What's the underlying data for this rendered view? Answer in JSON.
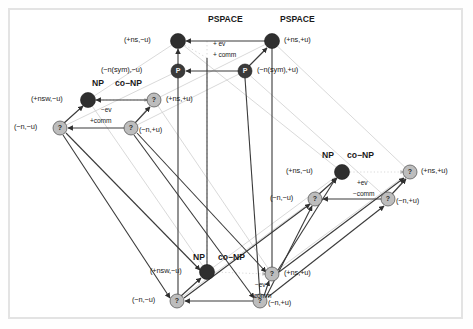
{
  "figure": {
    "background": "#ffffff",
    "frame_color": "#e3e3e3",
    "node_dark": "#2f2f2f",
    "node_light": "#bdbdbd",
    "edge_solid": "#3a3a3a",
    "edge_faint": "#cfcfcf",
    "text_color": "#1a1a1a"
  },
  "cubes": [
    {
      "id": "top",
      "class_label_left": "PSPACE",
      "class_label_right": "PSPACE",
      "op_line_1": "+ ev",
      "op_line_2": "+ comm",
      "nodes": [
        {
          "id": "t-back-left",
          "glyph": "",
          "fill": "dark",
          "label": "(+ns,−u)",
          "label_side": "left",
          "x": 178,
          "y": 41
        },
        {
          "id": "t-back-right",
          "glyph": "",
          "fill": "dark",
          "label": "(+ns,+u)",
          "label_side": "right",
          "x": 272,
          "y": 41
        },
        {
          "id": "t-front-left",
          "glyph": "P",
          "fill": "dark",
          "label": "(−n(sym),−u)",
          "label_side": "left",
          "x": 178,
          "y": 71
        },
        {
          "id": "t-front-right",
          "glyph": "P",
          "fill": "dark",
          "label": "(−n(sym),+u)",
          "label_side": "right",
          "x": 245,
          "y": 71
        }
      ]
    },
    {
      "id": "left",
      "class_label_left": "NP",
      "class_label_right": "co−NP",
      "op_line_1": "−ev",
      "op_line_2": "+comm",
      "nodes": [
        {
          "id": "l-back-left",
          "glyph": "",
          "fill": "dark",
          "label": "(+nsw,−u)",
          "label_side": "left",
          "x": 88,
          "y": 100
        },
        {
          "id": "l-back-right",
          "glyph": "?",
          "fill": "light",
          "label": "(+ns,+u)",
          "label_side": "right",
          "x": 154,
          "y": 100
        },
        {
          "id": "l-front-left",
          "glyph": "?",
          "fill": "light",
          "label": "(−n,−u)",
          "label_side": "left",
          "x": 60,
          "y": 128
        },
        {
          "id": "l-front-right",
          "glyph": "?",
          "fill": "light",
          "label": "(−n,+u)",
          "label_side": "right",
          "x": 131,
          "y": 128
        }
      ]
    },
    {
      "id": "right",
      "class_label_left": "NP",
      "class_label_right": "co−NP",
      "op_line_1": "+ev",
      "op_line_2": "−comm",
      "nodes": [
        {
          "id": "r-back-left",
          "glyph": "",
          "fill": "dark",
          "label": "(+ns,−u)",
          "label_side": "left",
          "x": 342,
          "y": 172
        },
        {
          "id": "r-back-right",
          "glyph": "?",
          "fill": "light",
          "label": "(+ns,+u)",
          "label_side": "right",
          "x": 410,
          "y": 172
        },
        {
          "id": "r-front-left",
          "glyph": "?",
          "fill": "light",
          "label": "(−n,−u)",
          "label_side": "left",
          "x": 315,
          "y": 199
        },
        {
          "id": "r-front-right",
          "glyph": "?",
          "fill": "light",
          "label": "(−n,+u)",
          "label_side": "right",
          "x": 388,
          "y": 199
        }
      ]
    },
    {
      "id": "bottom",
      "class_label_left": "NP",
      "class_label_right": "co−NP",
      "op_line_1": "−ev",
      "op_line_2": "−comm",
      "nodes": [
        {
          "id": "b-back-left",
          "glyph": "",
          "fill": "dark",
          "label": "(+nsw,−u)",
          "label_side": "left",
          "x": 207,
          "y": 272
        },
        {
          "id": "b-back-right",
          "glyph": "?",
          "fill": "light",
          "label": "(+ns,+u)",
          "label_side": "right",
          "x": 272,
          "y": 274
        },
        {
          "id": "b-front-left",
          "glyph": "?",
          "fill": "light",
          "label": "(−n,−u)",
          "label_side": "left",
          "x": 177,
          "y": 301
        },
        {
          "id": "b-front-right",
          "glyph": "?",
          "fill": "light",
          "label": "(−n,+u)",
          "label_side": "right",
          "x": 260,
          "y": 301
        }
      ]
    }
  ],
  "class_labels": [
    {
      "id": "top-left-class",
      "text": "PSPACE",
      "x": 208,
      "y": 22
    },
    {
      "id": "top-right-class",
      "text": "PSPACE",
      "x": 280,
      "y": 22
    },
    {
      "id": "left-np",
      "text": "NP",
      "x": 95,
      "y": 85
    },
    {
      "id": "left-conp",
      "text": "co−NP",
      "x": 118,
      "y": 85
    },
    {
      "id": "right-np",
      "text": "NP",
      "x": 325,
      "y": 158
    },
    {
      "id": "right-conp",
      "text": "co−NP",
      "x": 350,
      "y": 158
    },
    {
      "id": "bottom-np",
      "text": "NP",
      "x": 196,
      "y": 259
    },
    {
      "id": "bottom-conp",
      "text": "co−NP",
      "x": 221,
      "y": 259
    }
  ],
  "op_labels": [
    {
      "id": "top-op1",
      "text": "+ ev",
      "x": 214,
      "y": 44
    },
    {
      "id": "top-op2",
      "text": "+ comm",
      "x": 214,
      "y": 55
    },
    {
      "id": "left-op1",
      "text": "−ev",
      "x": 102,
      "y": 110
    },
    {
      "id": "left-op2",
      "text": "+comm",
      "x": 91,
      "y": 121
    },
    {
      "id": "right-op1",
      "text": "+ev",
      "x": 358,
      "y": 183
    },
    {
      "id": "right-op2",
      "text": "−comm",
      "x": 354,
      "y": 194
    },
    {
      "id": "bottom-op1",
      "text": "−ev",
      "x": 256,
      "y": 285
    },
    {
      "id": "bottom-op2",
      "text": "−comm",
      "x": 251,
      "y": 296
    }
  ],
  "node_labels": [
    {
      "id": "t-bl-label",
      "text": "(+ns,−u)",
      "x": 125,
      "y": 38,
      "align": "left"
    },
    {
      "id": "t-br-label",
      "text": "(+ns,+u)",
      "x": 286,
      "y": 38,
      "align": "left"
    },
    {
      "id": "t-fl-label",
      "text": "(−n(sym),−u)",
      "x": 103,
      "y": 68,
      "align": "left"
    },
    {
      "id": "t-fr-label",
      "text": "(−n(sym),+u)",
      "x": 259,
      "y": 68,
      "align": "left"
    },
    {
      "id": "l-bl-label",
      "text": "(+nsw,−u)",
      "x": 33,
      "y": 97,
      "align": "left"
    },
    {
      "id": "l-br-label",
      "text": "(+ns,+u)",
      "x": 168,
      "y": 97,
      "align": "left"
    },
    {
      "id": "l-fl-label",
      "text": "(−n,−u)",
      "x": 16,
      "y": 125,
      "align": "left"
    },
    {
      "id": "l-fr-label",
      "text": "(−n,+u)",
      "x": 141,
      "y": 128,
      "align": "left"
    },
    {
      "id": "r-bl-label",
      "text": "(+ns,−u)",
      "x": 288,
      "y": 169,
      "align": "left"
    },
    {
      "id": "r-br-label",
      "text": "(+ns,+u)",
      "x": 424,
      "y": 169,
      "align": "left"
    },
    {
      "id": "r-fl-label",
      "text": "(−n,−u)",
      "x": 272,
      "y": 196,
      "align": "left"
    },
    {
      "id": "r-fr-label",
      "text": "(−n,+u)",
      "x": 398,
      "y": 199,
      "align": "left"
    },
    {
      "id": "b-bl-label",
      "text": "(+nsw,−u)",
      "x": 152,
      "y": 269,
      "align": "left"
    },
    {
      "id": "b-br-label",
      "text": "(+ns,+u)",
      "x": 286,
      "y": 271,
      "align": "left"
    },
    {
      "id": "b-fl-label",
      "text": "(−n,−u)",
      "x": 134,
      "y": 298,
      "align": "left"
    },
    {
      "id": "b-fr-label",
      "text": "(−n,+u)",
      "x": 270,
      "y": 301,
      "align": "left"
    }
  ]
}
